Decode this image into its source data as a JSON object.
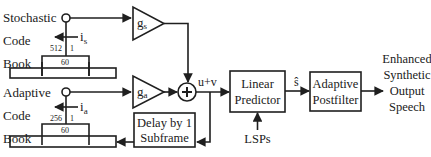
{
  "diagram": {
    "title": "",
    "stochastic_codebook": {
      "label_lines": [
        "Stochastic",
        "Code",
        "Book"
      ],
      "index_label": "i",
      "index_subscript": "s",
      "range_high": "512",
      "range_low": "1",
      "window_size": "60"
    },
    "adaptive_codebook": {
      "label_lines": [
        "Adaptive",
        "Code",
        "Book"
      ],
      "index_label": "i",
      "index_subscript": "a",
      "range_high": "256",
      "range_low": "1",
      "window_size": "60"
    },
    "gain_stochastic": {
      "label": "g",
      "subscript": "s"
    },
    "gain_adaptive": {
      "label": "g",
      "subscript": "a"
    },
    "adder": {
      "symbol": "+",
      "output_label": "u+v"
    },
    "delay_block": {
      "label_lines": [
        "Delay by 1",
        "Subframe"
      ]
    },
    "linear_predictor": {
      "label_lines": [
        "Linear",
        "Predictor"
      ],
      "input_label": "LSPs"
    },
    "predictor_output_label": "ŝ",
    "postfilter": {
      "label_lines": [
        "Adaptive",
        "Postfilter"
      ]
    },
    "output": {
      "label_lines": [
        "Enhanced",
        "Synthetic",
        "Output",
        "Speech"
      ]
    },
    "colors": {
      "line": "#1f1f1f",
      "background": "#ffffff"
    }
  }
}
